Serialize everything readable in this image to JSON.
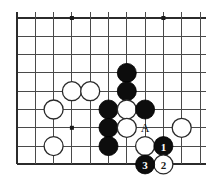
{
  "figure": {
    "type": "go-board-diagram",
    "board": {
      "columns": 11,
      "rows": 9,
      "origin_x": 17,
      "origin_y": 18,
      "spacing": 18.3,
      "line_color": "#4a4a4a",
      "edge_color": "#2b2b2b",
      "background_color": "#ffffff"
    },
    "star_points": [
      {
        "col": 3,
        "row": 0
      },
      {
        "col": 8,
        "row": 0
      },
      {
        "col": 3,
        "row": 6
      }
    ],
    "stones": [
      {
        "id": "b-c6r3",
        "color": "black",
        "col": 6,
        "row": 3,
        "label": ""
      },
      {
        "id": "w-c3r4",
        "color": "white",
        "col": 3,
        "row": 4,
        "label": ""
      },
      {
        "id": "w-c4r4",
        "color": "white",
        "col": 4,
        "row": 4,
        "label": ""
      },
      {
        "id": "b-c6r4",
        "color": "black",
        "col": 6,
        "row": 4,
        "label": ""
      },
      {
        "id": "w-c2r5",
        "color": "white",
        "col": 2,
        "row": 5,
        "label": ""
      },
      {
        "id": "b-c5r5",
        "color": "black",
        "col": 5,
        "row": 5,
        "label": ""
      },
      {
        "id": "w-c6r5",
        "color": "white",
        "col": 6,
        "row": 5,
        "label": ""
      },
      {
        "id": "b-c7r5",
        "color": "black",
        "col": 7,
        "row": 5,
        "label": ""
      },
      {
        "id": "b-c5r6",
        "color": "black",
        "col": 5,
        "row": 6,
        "label": ""
      },
      {
        "id": "w-c6r6",
        "color": "white",
        "col": 6,
        "row": 6,
        "label": ""
      },
      {
        "id": "w-c9r6",
        "color": "white",
        "col": 9,
        "row": 6,
        "label": ""
      },
      {
        "id": "w-c2r7",
        "color": "white",
        "col": 2,
        "row": 7,
        "label": ""
      },
      {
        "id": "b-c5r7",
        "color": "black",
        "col": 5,
        "row": 7,
        "label": ""
      },
      {
        "id": "w-c7r7",
        "color": "white",
        "col": 7,
        "row": 7,
        "label": ""
      },
      {
        "id": "b-c8r7",
        "color": "black",
        "col": 8,
        "row": 7,
        "label": "1"
      },
      {
        "id": "w-c8r8",
        "color": "white",
        "col": 8,
        "row": 8,
        "label": "2"
      },
      {
        "id": "b-c7r8",
        "color": "black",
        "col": 7,
        "row": 8,
        "label": "3"
      }
    ],
    "point_markers": [
      {
        "id": "marker-a",
        "text": "A",
        "col": 7,
        "row": 6
      }
    ],
    "move_sequence": [
      {
        "number": "1",
        "color": "black"
      },
      {
        "number": "2",
        "color": "white"
      },
      {
        "number": "3",
        "color": "black"
      }
    ]
  }
}
